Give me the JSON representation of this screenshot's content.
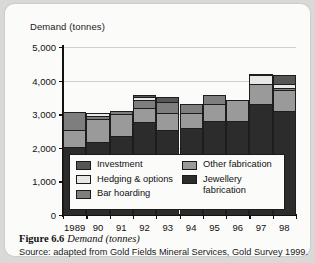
{
  "figure": {
    "number_label": "Figure 6.6",
    "title_italic": "Demand (tonnes)",
    "source": "Source: adapted from Gold Fields Mineral Services, Gold Survey 1999."
  },
  "colors": {
    "investment": "#565656",
    "hedging_options": "#e8e8e6",
    "bar_hoarding": "#7e7e7e",
    "other_fabrication": "#9a9a9a",
    "jewellery_fabrication": "#2c2c2c",
    "axis": "#111111",
    "grid": "#cfcfcf",
    "card": "#fbfbfa",
    "page": "#d9d9d7"
  },
  "legend": {
    "column_left": [
      {
        "key": "investment",
        "label": "Investment",
        "swatch": "#565656"
      },
      {
        "key": "hedging_options",
        "label": "Hedging & options",
        "swatch": "#e8e8e6"
      },
      {
        "key": "bar_hoarding",
        "label": "Bar hoarding",
        "swatch": "#7e7e7e"
      }
    ],
    "column_right": [
      {
        "key": "other_fabrication",
        "label": "Other fabrication",
        "swatch": "#9a9a9a"
      },
      {
        "key": "jewellery_fabrication",
        "label": "Jewellery\nfabrication",
        "swatch": "#2c2c2c"
      }
    ]
  },
  "chart_data": {
    "type": "bar",
    "subtype": "stacked",
    "title": "Demand (tonnes)",
    "xlabel": "",
    "ylabel": "Demand (tonnes)",
    "ylim": [
      0,
      5000
    ],
    "yticks": [
      0,
      1000,
      2000,
      3000,
      4000,
      5000
    ],
    "ytick_labels": [
      "0",
      "1,000",
      "2,000",
      "3,000",
      "4,000",
      "5,000"
    ],
    "grid": true,
    "legend_position": "inside-bottom",
    "categories": [
      "1989",
      "90",
      "91",
      "92",
      "93",
      "94",
      "95",
      "96",
      "97",
      "98"
    ],
    "series": [
      {
        "name": "Jewellery fabrication",
        "color": "#2c2c2c",
        "values": [
          2030,
          2160,
          2340,
          2760,
          2530,
          2600,
          2790,
          2810,
          3300,
          3110
        ]
      },
      {
        "name": "Other fabrication",
        "color": "#9a9a9a",
        "values": [
          500,
          700,
          670,
          420,
          510,
          440,
          520,
          620,
          600,
          610
        ]
      },
      {
        "name": "Bar hoarding",
        "color": "#7e7e7e",
        "values": [
          530,
          100,
          100,
          250,
          330,
          250,
          250,
          0,
          0,
          50
        ]
      },
      {
        "name": "Hedging & options",
        "color": "#e8e8e6",
        "values": [
          0,
          90,
          0,
          70,
          0,
          0,
          0,
          0,
          260,
          130
        ]
      },
      {
        "name": "Investment",
        "color": "#565656",
        "values": [
          0,
          0,
          0,
          70,
          130,
          0,
          0,
          0,
          40,
          260
        ]
      }
    ],
    "totals": [
      3060,
      3050,
      3110,
      3570,
      3500,
      3290,
      3560,
      3430,
      4200,
      4160
    ]
  }
}
